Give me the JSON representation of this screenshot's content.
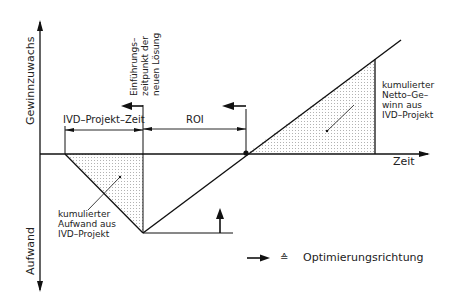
{
  "axes": {
    "y_up_label": "Gewinnzuwachs",
    "y_down_label": "Aufwand",
    "x_label": "Zeit"
  },
  "annotations": {
    "project_time": "IVD–Projekt–Zeit",
    "roi": "ROI",
    "introduction_line1": "Einführungs–",
    "introduction_line2": "zeitpunkt der",
    "introduction_line3": "neuen Lösung",
    "net_gain_line1": "kumulierter",
    "net_gain_line2": "Netto–Ge–",
    "net_gain_line3": "winn aus",
    "net_gain_line4": "IVD–Projekt",
    "effort_line1": "kumulierter",
    "effort_line2": "Aufwand aus",
    "effort_line3": "IVD–Projekt"
  },
  "legend": {
    "symbol": "≙",
    "label": "Optimierungsrichtung"
  },
  "colors": {
    "line": "#111111",
    "hatch": "#9a9a9a"
  }
}
